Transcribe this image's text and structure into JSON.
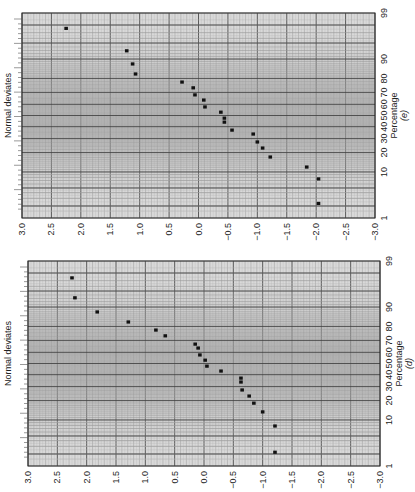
{
  "figure": {
    "orientation": "rotated 90 degrees clockwise; x-axis (Normal deviates) runs horizontally from 3.0 (left) to -3.0 (right), percentage axis vertical on right"
  },
  "chart_data": [
    {
      "type": "scatter",
      "panel_label": "(e)",
      "title": "",
      "xlabel": "Percentage",
      "ylabel": "Normal deviates",
      "deviate_ticks": [
        "3.0",
        "2.5",
        "2.0",
        "1.5",
        "1.0",
        "0.5",
        "0.0",
        "−0.5",
        "−1.0",
        "−1.5",
        "−2.0",
        "−2.5",
        "−3.0"
      ],
      "percentage_ticks": [
        "1",
        "10",
        "20",
        "30",
        "40",
        "50",
        "60",
        "70",
        "80",
        "90",
        "99"
      ],
      "ylim": [
        -3.0,
        3.0
      ],
      "xlim": [
        1,
        99
      ],
      "grid": true,
      "points": [
        {
          "percentage": 97.6,
          "deviate": 2.25
        },
        {
          "percentage": 92.9,
          "deviate": 1.22
        },
        {
          "percentage": 87.9,
          "deviate": 1.12
        },
        {
          "percentage": 82.7,
          "deviate": 1.07
        },
        {
          "percentage": 77.6,
          "deviate": 0.28
        },
        {
          "percentage": 73.5,
          "deviate": 0.09
        },
        {
          "percentage": 68.0,
          "deviate": 0.06
        },
        {
          "percentage": 63.7,
          "deviate": -0.09
        },
        {
          "percentage": 57.7,
          "deviate": -0.11
        },
        {
          "percentage": 53.0,
          "deviate": -0.38
        },
        {
          "percentage": 47.6,
          "deviate": -0.44
        },
        {
          "percentage": 44.0,
          "deviate": -0.44
        },
        {
          "percentage": 37.0,
          "deviate": -0.57
        },
        {
          "percentage": 33.7,
          "deviate": -0.93
        },
        {
          "percentage": 27.4,
          "deviate": -1.0
        },
        {
          "percentage": 23.0,
          "deviate": -1.09
        },
        {
          "percentage": 17.3,
          "deviate": -1.22
        },
        {
          "percentage": 12.1,
          "deviate": -1.84
        },
        {
          "percentage": 7.5,
          "deviate": -2.04
        },
        {
          "percentage": 2.3,
          "deviate": -2.04
        }
      ]
    },
    {
      "type": "scatter",
      "panel_label": "(d)",
      "title": "",
      "xlabel": "Percentage",
      "ylabel": "Normal deviates",
      "deviate_ticks": [
        "3.0",
        "2.5",
        "2.0",
        "1.5",
        "1.0",
        "0.5",
        "0.0",
        "−0.5",
        "−1.0",
        "−1.5",
        "−2.0",
        "−2.5",
        "−3.0"
      ],
      "percentage_ticks": [
        "1",
        "10",
        "20",
        "30",
        "40",
        "50",
        "60",
        "70",
        "80",
        "90",
        "99"
      ],
      "ylim": [
        -3.0,
        3.0
      ],
      "xlim": [
        1,
        99
      ],
      "grid": true,
      "points": [
        {
          "percentage": 97.4,
          "deviate": 2.25
        },
        {
          "percentage": 93.2,
          "deviate": 2.2
        },
        {
          "percentage": 87.9,
          "deviate": 1.82
        },
        {
          "percentage": 82.7,
          "deviate": 1.29
        },
        {
          "percentage": 77.6,
          "deviate": 0.82
        },
        {
          "percentage": 73.5,
          "deviate": 0.66
        },
        {
          "percentage": 67.0,
          "deviate": 0.15
        },
        {
          "percentage": 63.7,
          "deviate": 0.1
        },
        {
          "percentage": 57.7,
          "deviate": 0.07
        },
        {
          "percentage": 53.0,
          "deviate": -0.02
        },
        {
          "percentage": 47.6,
          "deviate": -0.05
        },
        {
          "percentage": 43.2,
          "deviate": -0.29
        },
        {
          "percentage": 37.0,
          "deviate": -0.63
        },
        {
          "percentage": 33.7,
          "deviate": -0.63
        },
        {
          "percentage": 27.4,
          "deviate": -0.65
        },
        {
          "percentage": 23.0,
          "deviate": -0.77
        },
        {
          "percentage": 18.4,
          "deviate": -0.85
        },
        {
          "percentage": 13.6,
          "deviate": -1.0
        },
        {
          "percentage": 7.8,
          "deviate": -1.21
        },
        {
          "percentage": 2.2,
          "deviate": -1.21
        }
      ]
    }
  ],
  "panels": [
    {
      "label": "(e)",
      "ylabel": "Normal deviates",
      "xlabel": "Percentage"
    },
    {
      "label": "(d)",
      "ylabel": "Normal deviates",
      "xlabel": "Percentage"
    }
  ]
}
